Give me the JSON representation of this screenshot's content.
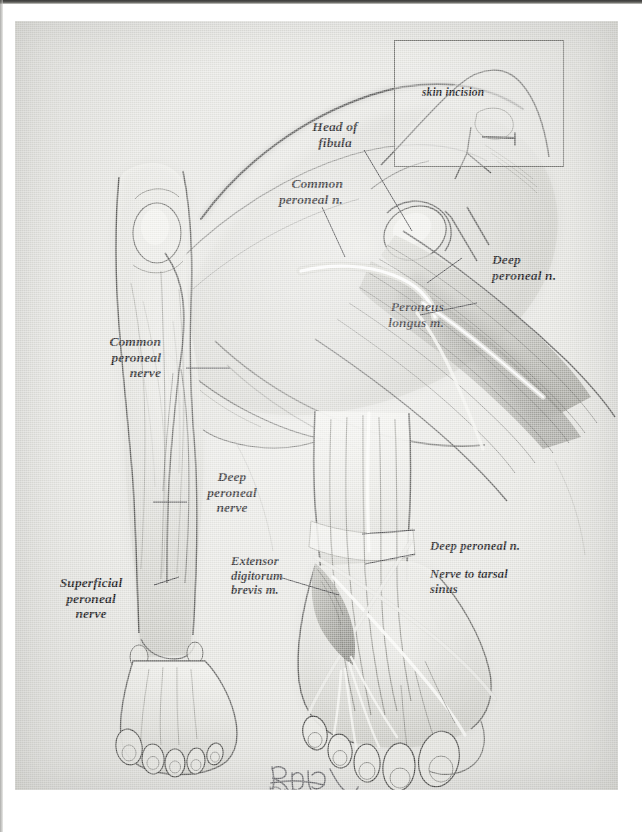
{
  "plate": {
    "type": "anatomical-illustration",
    "subject": "Common peroneal nerve, deep peroneal nerve and superficial peroneal nerve of the lower limb",
    "paper_color": "#e7e7e3",
    "ink_color": "#17171a"
  },
  "inset": {
    "name": "skin-incision-inset",
    "label": "skin incision"
  },
  "panels": {
    "knee": {
      "name": "lateral-knee-dissection",
      "labels": [
        {
          "id": "head-of-fibula",
          "text": "Head of\nfibula",
          "align": "center"
        },
        {
          "id": "common-peroneal-n",
          "text": "Common\nperoneal n.",
          "align": "right"
        },
        {
          "id": "deep-peroneal-n",
          "text": "Deep\nperoneal n.",
          "align": "left"
        },
        {
          "id": "peroneus-longus-m",
          "text": "Peroneus\nlongus m.",
          "align": "right"
        }
      ]
    },
    "leg": {
      "name": "anterior-leg-view",
      "labels": [
        {
          "id": "common-peroneal-nerve",
          "text": "Common\nperoneal\nnerve",
          "align": "right"
        },
        {
          "id": "deep-peroneal-nerve",
          "text": "Deep\nperoneal\nnerve",
          "align": "center"
        },
        {
          "id": "superficial-peroneal-nerve",
          "text": "Superficial\nperoneal\nnerve",
          "align": "center"
        }
      ]
    },
    "foot": {
      "name": "dorsum-of-foot-dissection",
      "labels": [
        {
          "id": "deep-peroneal-n-foot",
          "text": "Deep peroneal n.",
          "align": "left"
        },
        {
          "id": "nerve-to-tarsal-sinus",
          "text": "Nerve to tarsal\nsinus",
          "align": "left"
        },
        {
          "id": "extensor-digitorum-brevis-m",
          "text": "Extensor\ndigitorum\nbrevis m.",
          "align": "left"
        }
      ]
    }
  },
  "signature": {
    "name": "artist-signature",
    "copyright": "©2002"
  }
}
